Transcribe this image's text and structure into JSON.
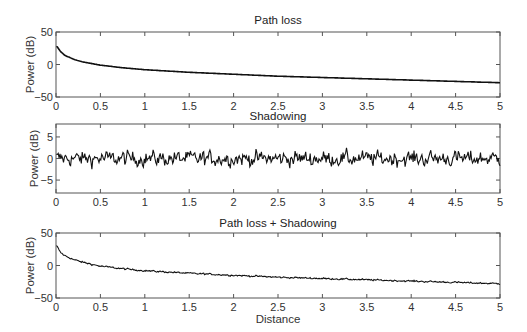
{
  "chart_data": [
    {
      "type": "line",
      "title": "Path loss",
      "xlabel": "",
      "ylabel": "Power (dB)",
      "xlim": [
        0,
        5
      ],
      "ylim": [
        -50,
        50
      ],
      "xticks": [
        "0",
        "0.5",
        "1",
        "1.5",
        "2",
        "2.5",
        "3",
        "3.5",
        "4",
        "4.5",
        "5"
      ],
      "yticks": [
        "-50",
        "0",
        "50"
      ],
      "grid": false,
      "series": [
        {
          "name": "Path loss",
          "x": [
            0.01,
            0.05,
            0.1,
            0.2,
            0.3,
            0.5,
            0.75,
            1,
            1.5,
            2,
            2.5,
            3,
            3.5,
            4,
            4.5,
            5
          ],
          "values": [
            28,
            20,
            14,
            8,
            4,
            -1,
            -5,
            -8,
            -12,
            -15,
            -18,
            -20,
            -22,
            -24,
            -26,
            -28
          ]
        }
      ]
    },
    {
      "type": "line",
      "title": "Shadowing",
      "xlabel": "",
      "ylabel": "Power (dB)",
      "xlim": [
        0,
        5
      ],
      "ylim": [
        -8,
        8
      ],
      "xticks": [
        "0",
        "0.5",
        "1",
        "1.5",
        "2",
        "2.5",
        "3",
        "3.5",
        "4",
        "4.5",
        "5"
      ],
      "yticks": [
        "-5",
        "0",
        "5"
      ],
      "grid": false,
      "series": [
        {
          "name": "Shadowing",
          "description": "Random noise around 0 dB, amplitude roughly within -5 to +5 dB",
          "mean": 0,
          "range": [
            -5.5,
            5
          ]
        }
      ]
    },
    {
      "type": "line",
      "title": "Path loss + Shadowing",
      "xlabel": "Distance",
      "ylabel": "Power (dB)",
      "xlim": [
        0,
        5
      ],
      "ylim": [
        -50,
        50
      ],
      "xticks": [
        "0",
        "0.5",
        "1",
        "1.5",
        "2",
        "2.5",
        "3",
        "3.5",
        "4",
        "4.5",
        "5"
      ],
      "yticks": [
        "-50",
        "0",
        "50"
      ],
      "grid": false,
      "series": [
        {
          "name": "Path loss + Shadowing",
          "x": [
            0.01,
            0.05,
            0.1,
            0.2,
            0.3,
            0.5,
            0.75,
            1,
            1.5,
            2,
            2.5,
            3,
            3.5,
            4,
            4.5,
            5
          ],
          "values": [
            30,
            20,
            15,
            9,
            5,
            -1,
            -5,
            -8,
            -12,
            -15,
            -18,
            -20,
            -22,
            -24,
            -26,
            -28
          ]
        }
      ]
    }
  ],
  "labels": {
    "title1": "Path loss",
    "title2": "Shadowing",
    "title3": "Path loss + Shadowing",
    "ylabel": "Power (dB)",
    "xlabel": "Distance"
  },
  "style": {
    "line_color": "#111111",
    "axis_color": "#555555"
  }
}
